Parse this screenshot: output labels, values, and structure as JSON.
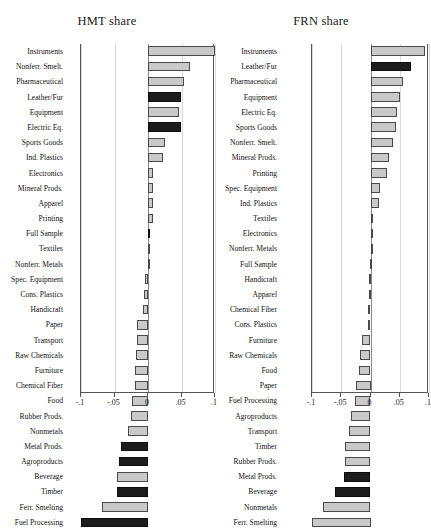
{
  "figure": {
    "background": "#ffffff",
    "bar_light_color": "#c9c9c9",
    "bar_dark_color": "#1c1c1c",
    "axis_color": "#555555",
    "grid_color": "#d9d9d9"
  },
  "chart_data": [
    {
      "type": "bar",
      "orientation": "horizontal",
      "title": "HMT share",
      "xlabel": "",
      "ylabel": "",
      "xlim": [
        -0.1,
        0.1
      ],
      "xticks": [
        -0.1,
        -0.05,
        0,
        0.05,
        0.1
      ],
      "xticklabels": [
        "-.1",
        "-.05",
        "0",
        ".05",
        ".1"
      ],
      "grid": true,
      "legend": "none",
      "categories": [
        "Instruments",
        "Nonferr. Smelt.",
        "Pharmaceutical",
        "Leather/Fur",
        "Equipment",
        "Electric Eq.",
        "Sports Goods",
        "Ind. Plastics",
        "Electronics",
        "Mineral Prods.",
        "Apparel",
        "Printing",
        "Full Sample",
        "Textiles",
        "Nonferr. Metals",
        "Spec. Equipment",
        "Cons. Plastics",
        "Handicraft",
        "Paper",
        "Transport",
        "Raw Chemicals",
        "Furniture",
        "Chemical Fiber",
        "Food",
        "Rubber Prods.",
        "Nonmetals",
        "Metal Prods.",
        "Agroproducts",
        "Beverage",
        "Timber",
        "Ferr. Smelting",
        "Fuel Processing"
      ],
      "values": [
        0.1,
        0.062,
        0.053,
        0.049,
        0.047,
        0.049,
        0.026,
        0.022,
        0.008,
        0.008,
        0.007,
        0.007,
        0.003,
        0.002,
        0.0,
        -0.004,
        -0.006,
        -0.007,
        -0.016,
        -0.017,
        -0.018,
        -0.019,
        -0.02,
        -0.024,
        -0.025,
        -0.03,
        -0.04,
        -0.043,
        -0.046,
        -0.047,
        -0.068,
        -0.1
      ],
      "shades": [
        "light",
        "light",
        "light",
        "dark",
        "light",
        "dark",
        "light",
        "light",
        "light",
        "light",
        "light",
        "light",
        "dark",
        "light",
        "light",
        "light",
        "light",
        "light",
        "light",
        "light",
        "light",
        "light",
        "light",
        "light",
        "light",
        "light",
        "dark",
        "dark",
        "light",
        "dark",
        "light",
        "dark"
      ]
    },
    {
      "type": "bar",
      "orientation": "horizontal",
      "title": "FRN share",
      "xlabel": "",
      "ylabel": "",
      "xlim": [
        -0.1,
        0.1
      ],
      "xticks": [
        -0.1,
        -0.05,
        0,
        0.05,
        0.1
      ],
      "xticklabels": [
        "-.1",
        "-.05",
        "0",
        ".05",
        ".1"
      ],
      "grid": true,
      "legend": "none",
      "categories": [
        "Instruments",
        "Leather/Fur",
        "Pharmaceutical",
        "Equipment",
        "Electric Eq.",
        "Sports Goods",
        "Nonferr. Smelt.",
        "Mineral Prods.",
        "Printing",
        "Spec. Equipment",
        "Ind. Plastics",
        "Textiles",
        "Electronics",
        "Nonferr. Metals",
        "Full Sample",
        "Handicraft",
        "Apparel",
        "Chemical Fiber",
        "Cons. Plastics",
        "Furniture",
        "Raw Chemicals",
        "Food",
        "Paper",
        "Fuel Processing",
        "Agroproducts",
        "Transport",
        "Timber",
        "Rubber Prods.",
        "Metal Prods.",
        "Beverage",
        "Nonmetals",
        "Ferr. Smelting"
      ],
      "values": [
        0.094,
        0.07,
        0.055,
        0.05,
        0.045,
        0.043,
        0.038,
        0.032,
        0.028,
        0.016,
        0.014,
        0.003,
        0.002,
        0.0,
        -0.001,
        -0.002,
        -0.003,
        -0.004,
        -0.005,
        -0.014,
        -0.018,
        -0.02,
        -0.025,
        -0.026,
        -0.033,
        -0.037,
        -0.043,
        -0.044,
        -0.046,
        -0.06,
        -0.082,
        -0.1
      ],
      "shades": [
        "light",
        "dark",
        "light",
        "light",
        "light",
        "light",
        "light",
        "light",
        "light",
        "light",
        "light",
        "light",
        "light",
        "light",
        "light",
        "light",
        "light",
        "light",
        "light",
        "light",
        "light",
        "light",
        "light",
        "light",
        "light",
        "light",
        "light",
        "light",
        "dark",
        "dark",
        "light",
        "light"
      ]
    }
  ]
}
